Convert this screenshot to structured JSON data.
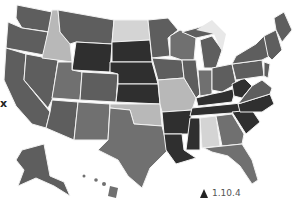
{
  "map": {
    "title": "United States choropleth map",
    "colors": {
      "darkest": "#2f2f2f",
      "dark": "#4a4a4a",
      "mid_dark": "#5e5e5e",
      "mid": "#707070",
      "mid_light": "#8a8a8a",
      "light": "#b8b8b8",
      "lightest": "#d4d4d4",
      "water": "#ffffff"
    },
    "states": [
      {
        "id": "WA",
        "shade": "mid_dark"
      },
      {
        "id": "OR",
        "shade": "mid_dark"
      },
      {
        "id": "CA",
        "shade": "mid_dark"
      },
      {
        "id": "ID",
        "shade": "light"
      },
      {
        "id": "NV",
        "shade": "mid_dark"
      },
      {
        "id": "MT",
        "shade": "mid_dark"
      },
      {
        "id": "WY",
        "shade": "darkest"
      },
      {
        "id": "UT",
        "shade": "mid"
      },
      {
        "id": "AZ",
        "shade": "mid_dark"
      },
      {
        "id": "CO",
        "shade": "mid_dark"
      },
      {
        "id": "NM",
        "shade": "mid"
      },
      {
        "id": "ND",
        "shade": "lightest"
      },
      {
        "id": "SD",
        "shade": "darkest"
      },
      {
        "id": "NE",
        "shade": "darkest"
      },
      {
        "id": "KS",
        "shade": "darkest"
      },
      {
        "id": "OK",
        "shade": "light"
      },
      {
        "id": "TX",
        "shade": "mid"
      },
      {
        "id": "MN",
        "shade": "mid_dark"
      },
      {
        "id": "IA",
        "shade": "mid_dark"
      },
      {
        "id": "MO",
        "shade": "light"
      },
      {
        "id": "AR",
        "shade": "darkest"
      },
      {
        "id": "LA",
        "shade": "darkest"
      },
      {
        "id": "WI",
        "shade": "mid"
      },
      {
        "id": "IL",
        "shade": "mid_dark"
      },
      {
        "id": "MI",
        "shade": "mid_dark"
      },
      {
        "id": "IN",
        "shade": "mid"
      },
      {
        "id": "OH",
        "shade": "mid_dark"
      },
      {
        "id": "KY",
        "shade": "darkest"
      },
      {
        "id": "TN",
        "shade": "darkest"
      },
      {
        "id": "MS",
        "shade": "darkest"
      },
      {
        "id": "AL",
        "shade": "lightest"
      },
      {
        "id": "GA",
        "shade": "mid"
      },
      {
        "id": "FL",
        "shade": "mid"
      },
      {
        "id": "SC",
        "shade": "darkest"
      },
      {
        "id": "NC",
        "shade": "darkest"
      },
      {
        "id": "VA",
        "shade": "mid_dark"
      },
      {
        "id": "WV",
        "shade": "darkest"
      },
      {
        "id": "PA",
        "shade": "mid_dark"
      },
      {
        "id": "NY",
        "shade": "mid_dark"
      },
      {
        "id": "NE_states",
        "shade": "mid_dark"
      },
      {
        "id": "ME",
        "shade": "mid_dark"
      },
      {
        "id": "AK",
        "shade": "mid_dark"
      },
      {
        "id": "HI",
        "shade": "mid"
      }
    ]
  },
  "labels": {
    "left_marker": "x",
    "version": "1.10.4"
  },
  "icons": {
    "version_icon": "triangle-up-icon"
  }
}
